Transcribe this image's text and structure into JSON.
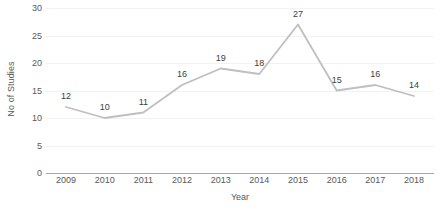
{
  "chart_data": {
    "type": "line",
    "title": "",
    "subtitle": "",
    "xlabel": "Year",
    "ylabel": "No of Studies",
    "categories": [
      "2009",
      "2010",
      "2011",
      "2012",
      "2013",
      "2014",
      "2015",
      "2016",
      "2017",
      "2018"
    ],
    "values": [
      12,
      10,
      11,
      16,
      19,
      18,
      27,
      15,
      16,
      14
    ],
    "data_labels": [
      "12",
      "10",
      "11",
      "16",
      "19",
      "18",
      "27",
      "15",
      "16",
      "14"
    ],
    "series": [
      {
        "name": "No of Studies",
        "values": [
          12,
          10,
          11,
          16,
          19,
          18,
          27,
          15,
          16,
          14
        ]
      }
    ],
    "ylim": [
      0,
      30
    ],
    "y_ticks": [
      0,
      5,
      10,
      15,
      20,
      25,
      30
    ],
    "y_tick_labels": [
      "0",
      "5",
      "10",
      "15",
      "20",
      "25",
      "30"
    ],
    "x_tick_labels": [
      "2009",
      "2010",
      "2011",
      "2012",
      "2013",
      "2014",
      "2015",
      "2016",
      "2017",
      "2018"
    ],
    "grid": true,
    "grid_axis": "y",
    "legend": false,
    "legend_position": "none",
    "line_color": "#BFBFBF",
    "axis_color": "#A6A6A6",
    "gridline_color": "#F2F2F2",
    "text_color": "#595959",
    "label_color": "#404040",
    "background_color": "#FFFFFF",
    "markers": false
  }
}
